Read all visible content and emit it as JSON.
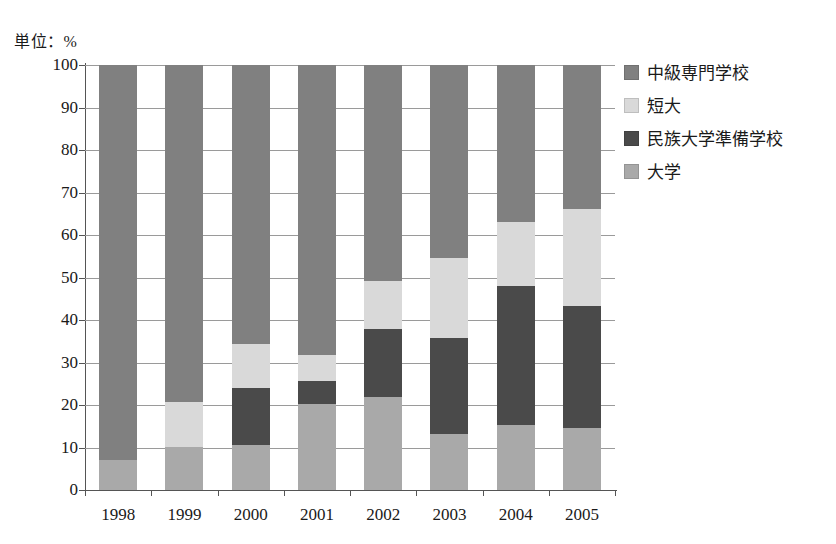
{
  "chart_data": {
    "type": "bar",
    "title": "",
    "subtitle": "",
    "unit_label": "単位：%",
    "xlabel": "",
    "ylabel": "",
    "ylim": [
      0,
      100
    ],
    "ytick_labels": [
      "0",
      "10",
      "20",
      "30",
      "40",
      "50",
      "60",
      "70",
      "80",
      "90",
      "100"
    ],
    "ytick_values": [
      0,
      10,
      20,
      30,
      40,
      50,
      60,
      70,
      80,
      90,
      100
    ],
    "grid": true,
    "stacked": true,
    "stack_total": 100,
    "legend_position": "right",
    "categories": [
      "1998",
      "1999",
      "2000",
      "2001",
      "2002",
      "2003",
      "2004",
      "2005"
    ],
    "series": [
      {
        "name": "大学",
        "color": "#a9a9a9",
        "values": [
          7.0,
          10.2,
          10.5,
          20.2,
          21.9,
          13.2,
          15.3,
          14.6
        ]
      },
      {
        "name": "民族大学準備学校",
        "color": "#4a4a4a",
        "values": [
          0.0,
          0.0,
          13.6,
          5.4,
          16.0,
          22.6,
          32.7,
          28.7
        ]
      },
      {
        "name": "短大",
        "color": "#d9d9d9",
        "values": [
          93.0,
          10.6,
          10.2,
          6.2,
          11.3,
          18.8,
          15.0,
          22.8
        ]
      },
      {
        "name": "中級専門学校",
        "color": "#808080",
        "values": [
          0.0,
          79.2,
          65.7,
          68.2,
          50.8,
          45.4,
          37.0,
          33.9
        ]
      }
    ],
    "legend": [
      {
        "label": "中級専門学校",
        "color": "#808080"
      },
      {
        "label": "短大",
        "color": "#d9d9d9"
      },
      {
        "label": "民族大学準備学校",
        "color": "#4a4a4a"
      },
      {
        "label": "大学",
        "color": "#a9a9a9"
      }
    ],
    "stacks": [
      {
        "year": "1998",
        "segments": [
          {
            "name": "大学",
            "from": 0.0,
            "to": 7.0,
            "color": "#a9a9a9"
          },
          {
            "name": "中級専門学校",
            "from": 7.0,
            "to": 100.0,
            "color": "#808080"
          }
        ]
      },
      {
        "year": "1999",
        "segments": [
          {
            "name": "大学",
            "from": 0.0,
            "to": 10.2,
            "color": "#a9a9a9"
          },
          {
            "name": "短大",
            "from": 10.2,
            "to": 20.8,
            "color": "#d9d9d9"
          },
          {
            "name": "中級専門学校",
            "from": 20.8,
            "to": 100.0,
            "color": "#808080"
          }
        ]
      },
      {
        "year": "2000",
        "segments": [
          {
            "name": "大学",
            "from": 0.0,
            "to": 10.5,
            "color": "#a9a9a9"
          },
          {
            "name": "民族大学準備学校",
            "from": 10.5,
            "to": 24.1,
            "color": "#4a4a4a"
          },
          {
            "name": "短大",
            "from": 24.1,
            "to": 34.3,
            "color": "#d9d9d9"
          },
          {
            "name": "中級専門学校",
            "from": 34.3,
            "to": 100.0,
            "color": "#808080"
          }
        ]
      },
      {
        "year": "2001",
        "segments": [
          {
            "name": "大学",
            "from": 0.0,
            "to": 20.2,
            "color": "#a9a9a9"
          },
          {
            "name": "民族大学準備学校",
            "from": 20.2,
            "to": 25.6,
            "color": "#4a4a4a"
          },
          {
            "name": "短大",
            "from": 25.6,
            "to": 31.8,
            "color": "#d9d9d9"
          },
          {
            "name": "中級専門学校",
            "from": 31.8,
            "to": 100.0,
            "color": "#808080"
          }
        ]
      },
      {
        "year": "2002",
        "segments": [
          {
            "name": "大学",
            "from": 0.0,
            "to": 21.9,
            "color": "#a9a9a9"
          },
          {
            "name": "民族大学準備学校",
            "from": 21.9,
            "to": 37.9,
            "color": "#4a4a4a"
          },
          {
            "name": "短大",
            "from": 37.9,
            "to": 49.2,
            "color": "#d9d9d9"
          },
          {
            "name": "中級専門学校",
            "from": 49.2,
            "to": 100.0,
            "color": "#808080"
          }
        ]
      },
      {
        "year": "2003",
        "segments": [
          {
            "name": "大学",
            "from": 0.0,
            "to": 13.2,
            "color": "#a9a9a9"
          },
          {
            "name": "民族大学準備学校",
            "from": 13.2,
            "to": 35.8,
            "color": "#4a4a4a"
          },
          {
            "name": "短大",
            "from": 35.8,
            "to": 54.6,
            "color": "#d9d9d9"
          },
          {
            "name": "中級専門学校",
            "from": 54.6,
            "to": 100.0,
            "color": "#808080"
          }
        ]
      },
      {
        "year": "2004",
        "segments": [
          {
            "name": "大学",
            "from": 0.0,
            "to": 15.3,
            "color": "#a9a9a9"
          },
          {
            "name": "民族大学準備学校",
            "from": 15.3,
            "to": 48.0,
            "color": "#4a4a4a"
          },
          {
            "name": "短大",
            "from": 48.0,
            "to": 63.0,
            "color": "#d9d9d9"
          },
          {
            "name": "中級専門学校",
            "from": 63.0,
            "to": 100.0,
            "color": "#808080"
          }
        ]
      },
      {
        "year": "2005",
        "segments": [
          {
            "name": "大学",
            "from": 0.0,
            "to": 14.6,
            "color": "#a9a9a9"
          },
          {
            "name": "民族大学準備学校",
            "from": 14.6,
            "to": 43.3,
            "color": "#4a4a4a"
          },
          {
            "name": "短大",
            "from": 43.3,
            "to": 66.1,
            "color": "#d9d9d9"
          },
          {
            "name": "中級専門学校",
            "from": 66.1,
            "to": 100.0,
            "color": "#808080"
          }
        ]
      }
    ]
  }
}
